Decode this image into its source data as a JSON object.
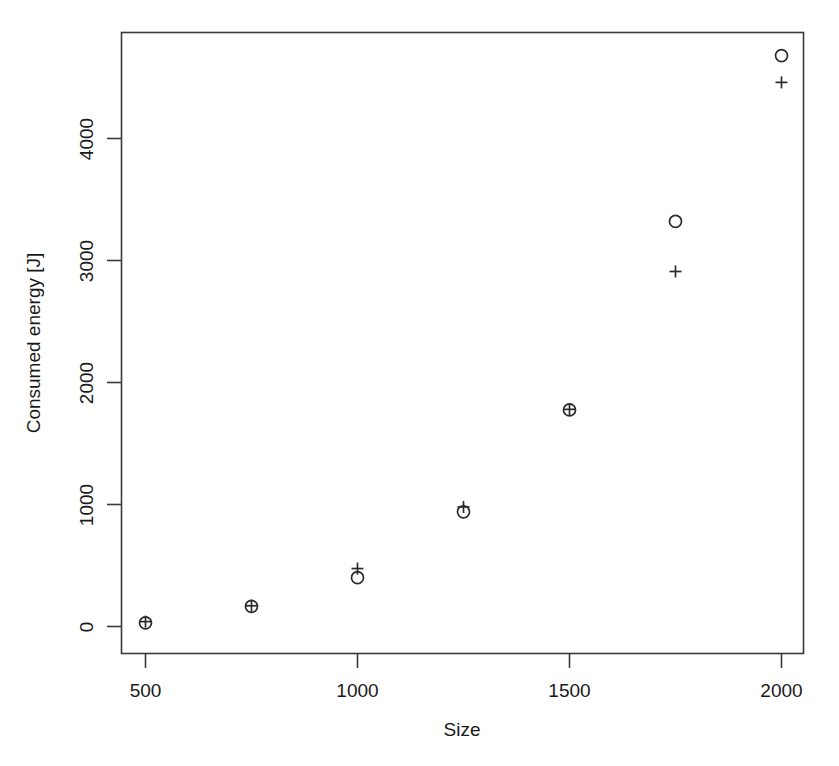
{
  "chart_data": {
    "type": "scatter",
    "title": "",
    "xlabel": "Size",
    "ylabel": "Consumed energy [J]",
    "xlim": [
      420,
      2060
    ],
    "ylim": [
      -220,
      4900
    ],
    "grid": false,
    "legend": null,
    "x_ticks": [
      500,
      1000,
      1500,
      2000
    ],
    "x_tick_labels": [
      "500",
      "1000",
      "1500",
      "2000"
    ],
    "y_ticks": [
      0,
      1000,
      2000,
      3000,
      4000
    ],
    "y_tick_labels": [
      "0",
      "1000",
      "2000",
      "3000",
      "4000"
    ],
    "x": [
      500,
      750,
      1000,
      1250,
      1500,
      1750,
      2000
    ],
    "series": [
      {
        "name": "circle",
        "marker": "o",
        "values": [
          30,
          165,
          400,
          940,
          1775,
          3320,
          4680
        ]
      },
      {
        "name": "plus",
        "marker": "+",
        "values": [
          40,
          170,
          475,
          980,
          1780,
          2910,
          4460
        ]
      }
    ]
  },
  "colors": {
    "axis": "#3a3a3a",
    "text": "#1a1a1a",
    "marker": "#2b2b2b",
    "background": "#ffffff"
  }
}
